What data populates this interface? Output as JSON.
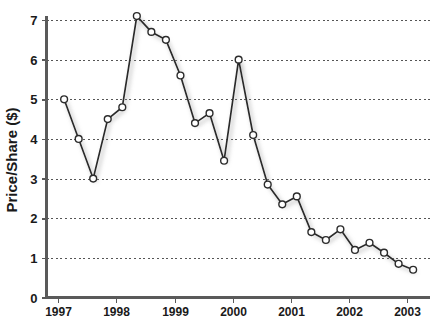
{
  "chart_data": {
    "type": "line",
    "title": "",
    "xlabel": "",
    "ylabel": "Price/Share ($)",
    "xlim": [
      1997.0,
      2003.2
    ],
    "ylim": [
      0,
      7.4
    ],
    "grid": true,
    "grid_axis": "y",
    "legend": false,
    "marker": "circle-open-white",
    "line_color": "#2b2b2b",
    "marker_face_color": "#ffffff",
    "marker_edge_color": "#2b2b2b",
    "shadow": true,
    "y_ticks": [
      0,
      1,
      2,
      3,
      4,
      5,
      6,
      7
    ],
    "y_tick_labels": [
      "0",
      "1",
      "2",
      "3",
      "4",
      "5",
      "6",
      "7"
    ],
    "x_ticks": [
      1997,
      1998,
      1999,
      2000,
      2001,
      2002,
      2003
    ],
    "x_tick_labels": [
      "1997",
      "1998",
      "1999",
      "2000",
      "2001",
      "2002",
      "2003"
    ],
    "series": [
      {
        "name": "Price/Share",
        "x": [
          1997.1,
          1997.35,
          1997.6,
          1997.85,
          1998.1,
          1998.35,
          1998.6,
          1998.85,
          1999.1,
          1999.35,
          1999.6,
          1999.85,
          2000.1,
          2000.35,
          2000.6,
          2000.85,
          2001.1,
          2001.35,
          2001.6,
          2001.85,
          2002.1,
          2002.35,
          2002.6,
          2002.85,
          2003.1
        ],
        "x_labels": [
          "1997 Q1",
          "1997 Q2",
          "1997 Q3",
          "1997 Q4",
          "1998 Q1",
          "1998 Q2",
          "1998 Q3",
          "1998 Q4",
          "1999 Q1",
          "1999 Q2",
          "1999 Q3",
          "1999 Q4",
          "2000 Q1",
          "2000 Q2",
          "2000 Q3",
          "2000 Q4",
          "2001 Q1",
          "2001 Q2",
          "2001 Q3",
          "2001 Q4",
          "2002 Q1",
          "2002 Q2",
          "2002 Q3",
          "2002 Q4",
          "2003 Q1"
        ],
        "values": [
          5.0,
          4.0,
          3.0,
          4.5,
          4.8,
          7.1,
          6.7,
          6.5,
          5.6,
          4.4,
          4.65,
          3.45,
          6.0,
          4.1,
          2.85,
          2.35,
          2.55,
          1.65,
          1.45,
          1.72,
          1.2,
          1.38,
          1.13,
          0.85,
          0.7
        ]
      }
    ]
  }
}
